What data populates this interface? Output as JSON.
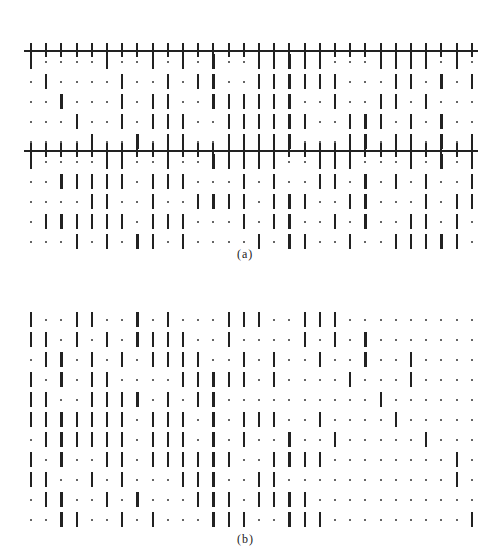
{
  "figure": {
    "panel_a": {
      "label": "(a)",
      "columns": 30,
      "boundary_lines_after_rows": [
        0,
        5
      ],
      "rows": [
        "|....|..|.|.|..|||||...||||.|.",
        ".|....|..|.||..||||||...||.|.|",
        "..|...|.||..||||||..|..||.|..",
        "...|..|.|||..||||||..|||.|.|.",
        "....|..|.||..|||||...||.||.|.|",
        "|....||..|..|||||..|||...|.|.|",
        "..|||||.|||...|.|..||.|.|.|..|",
        "....||..|..||||.|||..||...|.||",
        ".||||||.|||...|.||..|.|..||.|.",
        "...|.|.||.|....|.||..|..|||||."
      ]
    },
    "panel_b": {
      "label": "(b)",
      "columns": 30,
      "rows": [
        "|..||..|.|...|||..|||..........",
        "||.|.|.||||..|....|.|.|.......",
        ".||.|.|.||||..|.|..|..|..|.....",
        "|.|.||....|||||.|....|...|....",
        "||..||||.|.||..........|......",
        "|||||||.|||.|.|||..|....|.....",
        ".||||||.|||.|.|..|..|.....|...",
        "|.|..||.||||||..||||........|..",
        "||..|.|...|||..||...........|.",
        ".||..|.|...|||.||||...........|",
        "..||..|.|...|||..|||.........|"
      ]
    }
  }
}
